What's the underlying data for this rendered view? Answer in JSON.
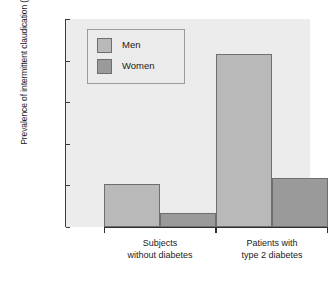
{
  "chart_data": {
    "type": "bar",
    "title": "",
    "xlabel": "",
    "ylabel": "Prevalence of intermittent claudication (%)",
    "categories": [
      "Subjects without diabetes",
      "Patients with type 2 diabetes"
    ],
    "category_lines": [
      [
        "Subjects",
        "without diabetes"
      ],
      [
        "Patients with",
        "type 2 diabetes"
      ]
    ],
    "series": [
      {
        "name": "Men",
        "values": [
          5.2,
          20.8
        ],
        "color": "#b9b9b9"
      },
      {
        "name": "Women",
        "values": [
          1.7,
          5.9
        ],
        "color": "#9a9a9a"
      }
    ],
    "ylim": [
      0,
      25
    ],
    "yticks": [
      0,
      5,
      10,
      15,
      20,
      25
    ],
    "ytick_labels": [
      "0",
      "5",
      "10",
      "15",
      "20",
      "25"
    ],
    "grid": false,
    "legend_position": "top-left",
    "panel_color": "#ececec",
    "bar_edge_color": "#6e6e6e",
    "axis_color": "#2f2f2f"
  }
}
